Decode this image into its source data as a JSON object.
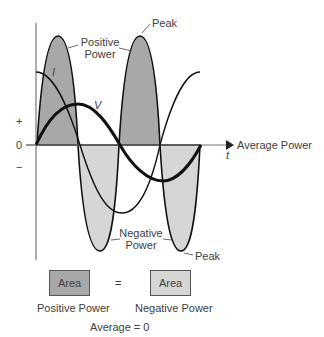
{
  "colors": {
    "positive_fill": "#a8a8a8",
    "negative_fill": "#d6d6d6",
    "curve": "#111111",
    "axis": "#777777",
    "text": "#404040"
  },
  "axis": {
    "plus_label": "+",
    "zero_label": "0",
    "minus_label": "−",
    "time_label": "t",
    "arrow_label": "Average Power"
  },
  "curves": {
    "current_label": "I",
    "voltage_label": "V"
  },
  "annotations": {
    "positive_power_line1": "Positive",
    "positive_power_line2": "Power",
    "negative_power_line1": "Negative",
    "negative_power_line2": "Power",
    "peak_top": "Peak",
    "peak_bottom": "Peak"
  },
  "legend": {
    "left_box": "Area",
    "equals": "=",
    "right_box": "Area",
    "left_caption": "Positive Power",
    "right_caption": "Negative Power",
    "summary": "Average = 0"
  }
}
